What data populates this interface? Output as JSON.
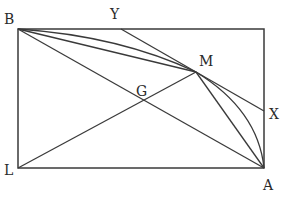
{
  "diagram": {
    "type": "geometry",
    "stroke_color": "#3a3a3a",
    "label_color": "#2a2a2a",
    "points": {
      "B": {
        "label": "B",
        "x": 18,
        "y": 29
      },
      "Y": {
        "label": "Y",
        "x": 121,
        "y": 29
      },
      "M": {
        "label": "M",
        "x": 196,
        "y": 72
      },
      "G": {
        "label": "G",
        "x": 143,
        "y": 101
      },
      "X": {
        "label": "X",
        "x": 264,
        "y": 111
      },
      "L": {
        "label": "L",
        "x": 18,
        "y": 168
      },
      "A": {
        "label": "A",
        "x": 264,
        "y": 168
      }
    },
    "segments": [
      "B-top_right",
      "top_right-A",
      "A-L",
      "L-B",
      "B-A",
      "L-M",
      "B-M",
      "Y-X",
      "M-A"
    ],
    "curves": [
      "arc B-M (bulging upward)",
      "arc M-A (bulging rightward)"
    ]
  }
}
